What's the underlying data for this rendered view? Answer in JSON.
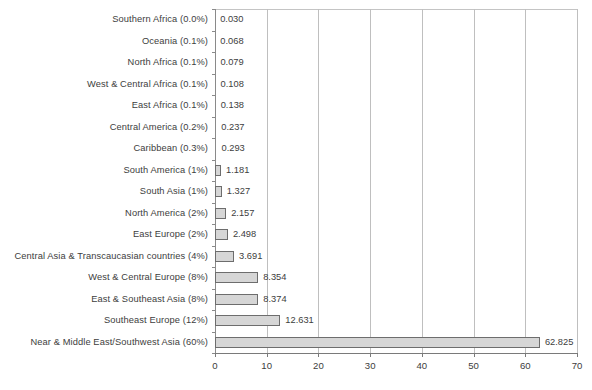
{
  "chart_data": {
    "type": "bar",
    "orientation": "horizontal",
    "title": "",
    "subtitle": "",
    "xlabel": "",
    "ylabel": "",
    "xlim": [
      0,
      70
    ],
    "xticks": [
      0,
      10,
      20,
      30,
      40,
      50,
      60,
      70
    ],
    "xtick_labels": [
      "0",
      "10",
      "20",
      "30",
      "40",
      "50",
      "60",
      "70"
    ],
    "grid": "vertical",
    "legend": "none",
    "bar_fill_color": "#d6d6d6",
    "bar_border_color": "#6d6d6d",
    "gridline_color": "#bfbfbf",
    "axis_color": "#7a7a7a",
    "text_color": "#3d3d3d",
    "categories": [
      "Southern Africa (0.0%)",
      "Oceania (0.1%)",
      "North Africa (0.1%)",
      "West & Central Africa (0.1%)",
      "East Africa (0.1%)",
      "Central America (0.2%)",
      "Caribbean (0.3%)",
      "South America (1%)",
      "South Asia (1%)",
      "North America (2%)",
      "East Europe (2%)",
      "Central Asia & Transcaucasian countries (4%)",
      "West & Central Europe (8%)",
      "East & Southeast Asia (8%)",
      "Southeast Europe (12%)",
      "Near & Middle East/Southwest Asia (60%)"
    ],
    "values": [
      0.03,
      0.068,
      0.079,
      0.108,
      0.138,
      0.237,
      0.293,
      1.181,
      1.327,
      2.157,
      2.498,
      3.691,
      8.354,
      8.374,
      12.631,
      62.825
    ],
    "value_labels": [
      "0.030",
      "0.068",
      "0.079",
      "0.108",
      "0.138",
      "0.237",
      "0.293",
      "1.181",
      "1.327",
      "2.157",
      "2.498",
      "3.691",
      "8.354",
      "8.374",
      "12.631",
      "62.825"
    ],
    "region_shares_percent": [
      "0.0%",
      "0.1%",
      "0.1%",
      "0.1%",
      "0.1%",
      "0.2%",
      "0.3%",
      "1%",
      "1%",
      "2%",
      "2%",
      "4%",
      "8%",
      "8%",
      "12%",
      "60%"
    ],
    "region_names": [
      "Southern Africa",
      "Oceania",
      "North Africa",
      "West & Central Africa",
      "East Africa",
      "Central America",
      "Caribbean",
      "South America",
      "South Asia",
      "North America",
      "East Europe",
      "Central Asia & Transcaucasian countries",
      "West & Central Europe",
      "East & Southeast Asia",
      "Southeast Europe",
      "Near & Middle East/Southwest Asia"
    ]
  }
}
